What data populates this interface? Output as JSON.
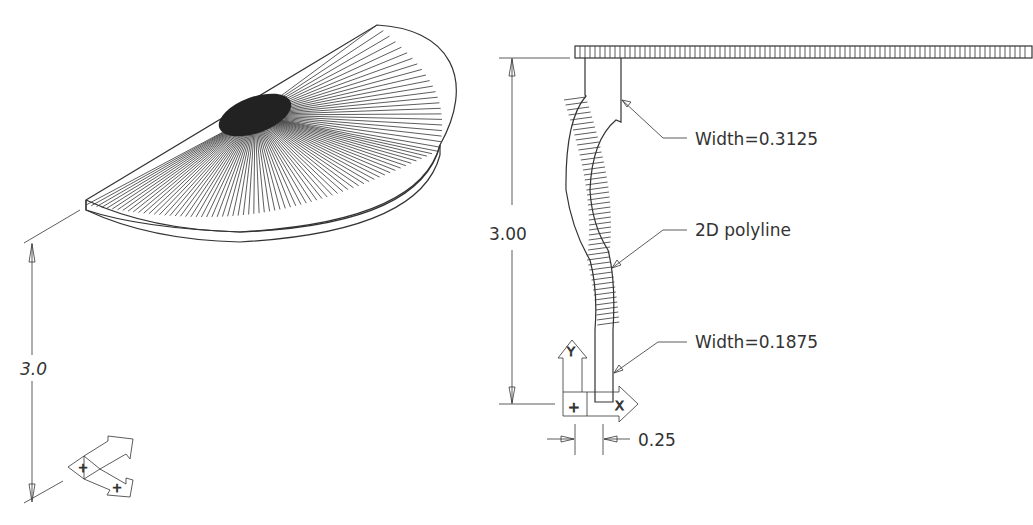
{
  "left_view": {
    "title": "Revolved surface (isometric)",
    "dimension_label": "3.0",
    "ucs_icon": {
      "x_label": "+",
      "y_label": "Y",
      "origin_label": "+"
    }
  },
  "right_view": {
    "height_dimension": "3.00",
    "width_dimension": "0.25",
    "annotations": {
      "top_width": "Width=0.3125",
      "polyline": "2D polyline",
      "bottom_width": "Width=0.1875"
    },
    "ucs_icon": {
      "x_label": "X",
      "y_label": "Y",
      "origin_label": "+"
    }
  }
}
